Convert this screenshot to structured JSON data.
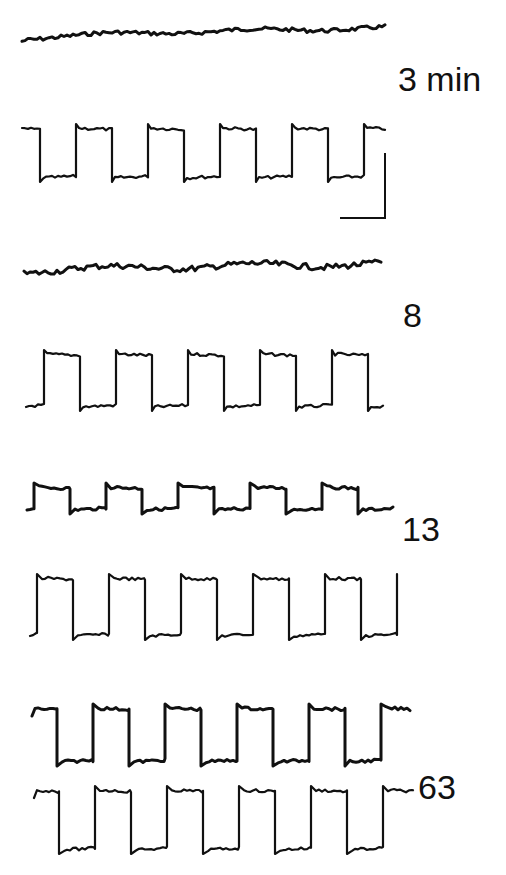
{
  "labels": {
    "t1": "3 min",
    "t2": "8",
    "t3": "13",
    "t4": "63"
  },
  "chart_data": {
    "type": "line",
    "title": "",
    "xlabel": "",
    "ylabel": "",
    "scale_bar": {
      "x": 340,
      "y1": 153,
      "y2": 218,
      "x2": 385
    },
    "grid": false,
    "legend": null,
    "panels": [
      {
        "label": "3 min",
        "traces": [
          {
            "name": "upper",
            "kind": "flat",
            "x0": 22,
            "x1": 385,
            "y": 40,
            "drift": -12,
            "amp": 4
          },
          {
            "name": "lower",
            "kind": "square",
            "x0": 22,
            "x1": 385,
            "high": 128,
            "low": 178,
            "cycles": 5,
            "phase": "low-first",
            "start": 40,
            "period": 72
          }
        ]
      },
      {
        "label": "8",
        "traces": [
          {
            "name": "upper",
            "kind": "flat",
            "x0": 24,
            "x1": 383,
            "y": 272,
            "drift": -8,
            "amp": 6
          },
          {
            "name": "lower",
            "kind": "square",
            "x0": 26,
            "x1": 383,
            "high": 354,
            "low": 407,
            "cycles": 5,
            "phase": "high-first",
            "start": 44,
            "period": 72
          }
        ]
      },
      {
        "label": "13",
        "traces": [
          {
            "name": "upper",
            "kind": "square",
            "x0": 27,
            "x1": 393,
            "high": 487,
            "low": 510,
            "cycles": 5,
            "phase": "high-first",
            "start": 34,
            "period": 72
          },
          {
            "name": "lower",
            "kind": "square",
            "x0": 30,
            "x1": 398,
            "high": 578,
            "low": 636,
            "cycles": 5,
            "phase": "high-first",
            "start": 37,
            "period": 72
          }
        ]
      },
      {
        "label": "63",
        "traces": [
          {
            "name": "upper",
            "kind": "square",
            "x0": 32,
            "x1": 410,
            "high": 708,
            "low": 762,
            "cycles": 5,
            "phase": "low-first",
            "start": 57,
            "period": 72
          },
          {
            "name": "lower",
            "kind": "square",
            "x0": 34,
            "x1": 413,
            "high": 790,
            "low": 850,
            "cycles": 5,
            "phase": "low-first",
            "start": 59,
            "period": 72
          }
        ]
      }
    ]
  }
}
